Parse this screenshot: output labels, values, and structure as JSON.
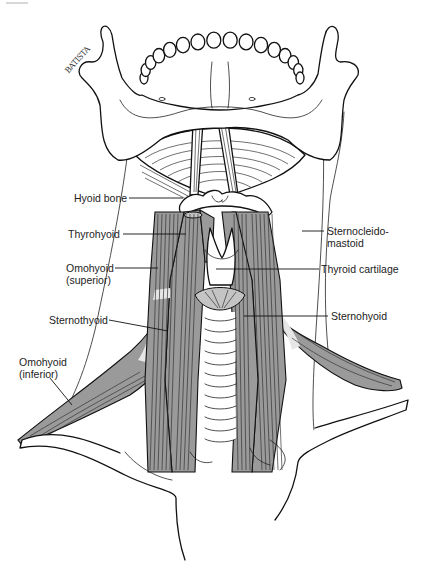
{
  "figure": {
    "artist_signature": "BATISTA",
    "colors": {
      "line": "#111111",
      "muscle_fill": "#9a9a9a",
      "background": "#ffffff",
      "label_text": "#222222"
    }
  },
  "labels": {
    "hyoid_bone": "Hyoid bone",
    "thyrohyoid": "Thyrohyoid",
    "omohyoid_superior": "Omohyoid\n(superior)",
    "sternothyoid": "Sternothyoid",
    "omohyoid_inferior": "Omohyoid\n(inferior)",
    "sternocleidomastoid": "Sternocleido-\nmastoid",
    "thyroid_cartilage": "Thyroid cartilage",
    "sternohyoid": "Sternohyoid"
  },
  "structures": [
    "mandible",
    "teeth",
    "mylohyoid",
    "digastric (anterior bellies)",
    "hyoid bone",
    "thyrohyoid",
    "thyroid cartilage",
    "cricoid",
    "trachea",
    "sternohyoid",
    "sternothyroid",
    "omohyoid",
    "sternocleidomastoid",
    "clavicle",
    "sternum"
  ]
}
